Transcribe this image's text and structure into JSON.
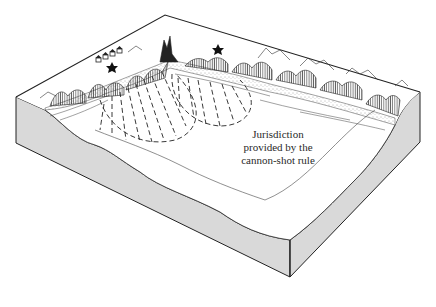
{
  "figure": {
    "annotation": {
      "lines": [
        "Jurisdiction",
        "provided by the",
        "cannon-shot rule"
      ]
    },
    "colors": {
      "ink": "#222222",
      "block_side": "#d9d9d9",
      "sea_surface": "#ffffff",
      "beach_stipple": "#555555"
    },
    "features": {
      "settlement_houses": 4,
      "fortification_markers": 2,
      "jurisdiction_arcs": 2
    }
  }
}
